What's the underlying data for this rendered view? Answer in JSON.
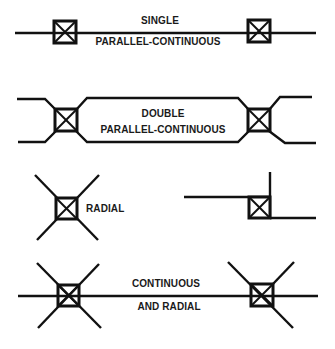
{
  "diagram": {
    "type": "connection-configurations",
    "colors": {
      "line": "#111111",
      "background": "#ffffff"
    },
    "sections": [
      {
        "id": "single",
        "label_line1": "SINGLE",
        "label_line2": "PARALLEL-CONTINUOUS"
      },
      {
        "id": "double",
        "label_line1": "DOUBLE",
        "label_line2": "PARALLEL-CONTINUOUS"
      },
      {
        "id": "radial",
        "label_line1": "RADIAL"
      },
      {
        "id": "continuous-radial",
        "label_line1": "CONTINUOUS",
        "label_line2": "AND RADIAL"
      }
    ]
  }
}
